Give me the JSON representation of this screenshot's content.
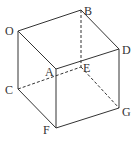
{
  "diagram": {
    "type": "cube",
    "vertices": {
      "O": {
        "x": 18,
        "y": 31
      },
      "B": {
        "x": 81,
        "y": 10
      },
      "D": {
        "x": 119,
        "y": 49
      },
      "A": {
        "x": 56,
        "y": 69
      },
      "E": {
        "x": 81,
        "y": 67
      },
      "C": {
        "x": 18,
        "y": 89
      },
      "F": {
        "x": 56,
        "y": 128
      },
      "G": {
        "x": 119,
        "y": 108
      }
    },
    "labels": [
      {
        "text": "O",
        "x": 5,
        "y": 35
      },
      {
        "text": "B",
        "x": 84,
        "y": 15
      },
      {
        "text": "D",
        "x": 122,
        "y": 54
      },
      {
        "text": "A",
        "x": 45,
        "y": 76
      },
      {
        "text": "E",
        "x": 83,
        "y": 72
      },
      {
        "text": "C",
        "x": 5,
        "y": 94
      },
      {
        "text": "F",
        "x": 43,
        "y": 134
      },
      {
        "text": "G",
        "x": 122,
        "y": 116
      }
    ],
    "solid_edges": [
      [
        "O",
        "B"
      ],
      [
        "B",
        "D"
      ],
      [
        "O",
        "A"
      ],
      [
        "A",
        "D"
      ],
      [
        "O",
        "C"
      ],
      [
        "A",
        "F"
      ],
      [
        "D",
        "G"
      ],
      [
        "C",
        "F"
      ],
      [
        "F",
        "G"
      ]
    ],
    "hidden_edges": [
      [
        "B",
        "E"
      ],
      [
        "C",
        "E"
      ],
      [
        "E",
        "G"
      ]
    ],
    "line_color": "#333333"
  }
}
